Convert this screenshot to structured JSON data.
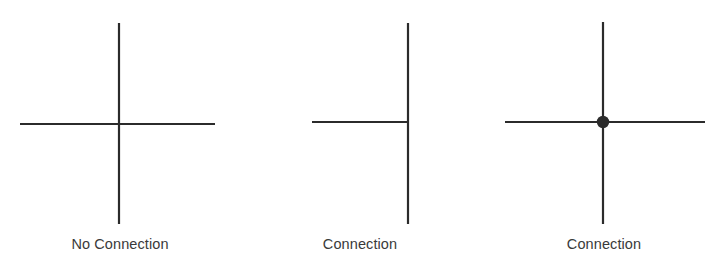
{
  "page": {
    "background_color": "#ffffff",
    "line_color": "#2b2b2b",
    "label_color": "#3a3a3a",
    "line_width_px": 2.2
  },
  "figures": [
    {
      "id": "no-connection",
      "caption": "No Connection",
      "junction_style": "crossing-no-dot",
      "has_dot": false,
      "vertical": {
        "x": 119,
        "y1": 23,
        "y2": 224
      },
      "horizontal": {
        "y": 124,
        "x1": 20,
        "x2": 215
      },
      "caption_y": 244
    },
    {
      "id": "tee-connection",
      "caption": "Connection",
      "junction_style": "tee-junction",
      "has_dot": false,
      "vertical": {
        "x": 168,
        "y1": 23,
        "y2": 224
      },
      "horizontal": {
        "y": 122,
        "x1": 72,
        "x2": 168
      },
      "caption_y": 244
    },
    {
      "id": "dot-connection",
      "caption": "Connection",
      "junction_style": "crossing-with-dot",
      "has_dot": true,
      "vertical": {
        "x": 123,
        "y1": 22,
        "y2": 224
      },
      "horizontal": {
        "y": 122,
        "x1": 25,
        "x2": 225
      },
      "dot": {
        "cx": 123,
        "cy": 122,
        "r": 6.2
      },
      "caption_y": 244
    }
  ]
}
